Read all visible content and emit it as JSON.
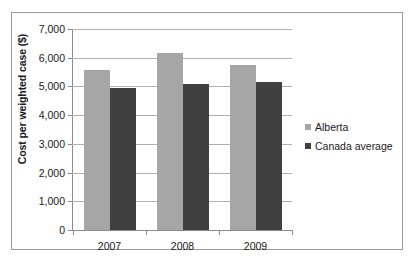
{
  "chart_data": {
    "type": "bar",
    "title": "",
    "subtitle": "",
    "xlabel": "",
    "ylabel": "Cost per weighted case ($)",
    "categories": [
      "2007",
      "2008",
      "2009"
    ],
    "series": [
      {
        "name": "Alberta",
        "color": "#a6a6a6",
        "values": [
          5570,
          6170,
          5750
        ]
      },
      {
        "name": "Canada average",
        "color": "#404040",
        "values": [
          4950,
          5090,
          5160
        ]
      }
    ],
    "ylim": [
      0,
      7000
    ],
    "ytick_values": [
      0,
      1000,
      2000,
      3000,
      4000,
      5000,
      6000,
      7000
    ],
    "ytick_labels": [
      "0",
      "1,000",
      "2,000",
      "3,000",
      "4,000",
      "5,000",
      "6,000",
      "7,000"
    ],
    "grid": "horizontal",
    "legend_position": "right"
  },
  "frame": {
    "border_color": "#9a9a9a",
    "background": "#ffffff"
  }
}
